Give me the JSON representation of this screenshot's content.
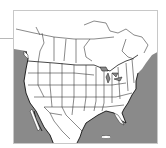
{
  "map": {
    "subject": "North America political map (US states and Canadian provinces)",
    "colors": {
      "ocean": "#8a8a8a",
      "land": "#ffffff",
      "borders": "#2a2a2a",
      "frame": "#c8c8c8",
      "leader_line": "#b8b8b8"
    },
    "regions": [
      "Canada",
      "United States",
      "Mexico",
      "Pacific Ocean",
      "Atlantic Ocean",
      "Gulf of Mexico"
    ]
  }
}
